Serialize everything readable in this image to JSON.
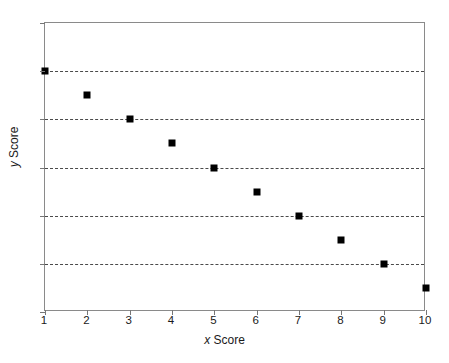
{
  "chart_data": {
    "type": "scatter",
    "title": "",
    "xlabel_variable": "x",
    "xlabel_rest": " Score",
    "xlabel": "x Score",
    "ylabel_variable": "y",
    "ylabel_rest": " Score",
    "ylabel": "y Score",
    "x": [
      1,
      2,
      3,
      4,
      5,
      6,
      7,
      8,
      9,
      10
    ],
    "values": [
      10,
      9,
      8,
      7,
      6,
      5,
      4,
      3,
      2,
      1
    ],
    "points": [
      {
        "x": 1,
        "y": 10
      },
      {
        "x": 2,
        "y": 9
      },
      {
        "x": 3,
        "y": 8
      },
      {
        "x": 4,
        "y": 7
      },
      {
        "x": 5,
        "y": 6
      },
      {
        "x": 6,
        "y": 5
      },
      {
        "x": 7,
        "y": 4
      },
      {
        "x": 8,
        "y": 3
      },
      {
        "x": 9,
        "y": 2
      },
      {
        "x": 10,
        "y": 1
      }
    ],
    "xlim": [
      1,
      10
    ],
    "ylim": [
      0,
      12
    ],
    "xticks": [
      1,
      2,
      3,
      4,
      5,
      6,
      7,
      8,
      9,
      10
    ],
    "yticks": [
      0,
      2,
      4,
      6,
      8,
      10,
      12
    ],
    "xtick_labels": [
      "1",
      "2",
      "3",
      "4",
      "5",
      "6",
      "7",
      "8",
      "9",
      "10"
    ],
    "ytick_labels": [
      "0",
      "2",
      "4",
      "6",
      "8",
      "10",
      "12"
    ],
    "gridlines_y": [
      2,
      4,
      6,
      8,
      10
    ],
    "grid": "horizontal-dashed",
    "legend": null,
    "marker_color": "#000000",
    "marker_shape": "square",
    "grid_color": "#4a4a4a",
    "frame_color": "#8a8a8a",
    "background_color": "#ffffff"
  }
}
